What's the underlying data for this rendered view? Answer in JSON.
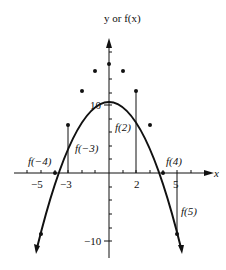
{
  "graph": {
    "y_axis_label": "y or f(x)",
    "x_axis_label": "x",
    "function": "f(x) = 16 - x^2",
    "x_tick_labels": [
      {
        "value": -5,
        "text": "−5"
      },
      {
        "value": -3,
        "text": "−3"
      },
      {
        "value": 2,
        "text": "2"
      },
      {
        "value": 5,
        "text": "5"
      }
    ],
    "y_tick_labels": [
      {
        "value": 10,
        "text": "10"
      },
      {
        "value": -10,
        "text": "−10"
      }
    ],
    "annotations": [
      {
        "x": -4,
        "text": "f(−4)"
      },
      {
        "x": -3,
        "text": "f(−3)"
      },
      {
        "x": 2,
        "text": "f(2)"
      },
      {
        "x": 4,
        "text": "f(4)"
      },
      {
        "x": 5,
        "text": "f(5)"
      }
    ],
    "points": [
      {
        "x": -5,
        "y": -9
      },
      {
        "x": -4,
        "y": 0
      },
      {
        "x": -3,
        "y": 7
      },
      {
        "x": -2,
        "y": 12
      },
      {
        "x": -1,
        "y": 15
      },
      {
        "x": 0,
        "y": 16
      },
      {
        "x": 1,
        "y": 15
      },
      {
        "x": 2,
        "y": 12
      },
      {
        "x": 3,
        "y": 7
      },
      {
        "x": 4,
        "y": 0
      },
      {
        "x": 5,
        "y": -9
      }
    ]
  }
}
